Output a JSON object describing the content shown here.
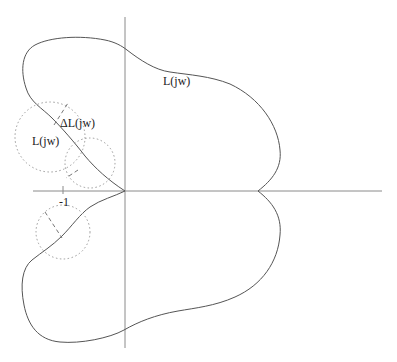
{
  "diagram": {
    "type": "nyquist-plot",
    "colors": {
      "axis": "#8a8a8a",
      "curve": "#555555",
      "uncertainty_circle": "#9a9a9a",
      "text": "#222222"
    },
    "labels": {
      "curve_upper_right": "L(jw)",
      "curve_point": "L(jw)",
      "uncertainty": "ΔL(jw)",
      "critical_point": "-1"
    },
    "axes": {
      "real_axis": {
        "from": [
          33,
          191
        ],
        "to": [
          382,
          191
        ]
      },
      "imag_axis": {
        "from": [
          125,
          17
        ],
        "to": [
          125,
          348
        ]
      },
      "origin": [
        125,
        191
      ]
    },
    "uncertainty_disks": [
      {
        "name": "large-disk",
        "cx": 50,
        "cy": 137,
        "r": 35
      },
      {
        "name": "small-disk",
        "cx": 90,
        "cy": 163,
        "r": 25
      },
      {
        "name": "lower-disk",
        "cx": 63,
        "cy": 232,
        "r": 27
      }
    ]
  }
}
